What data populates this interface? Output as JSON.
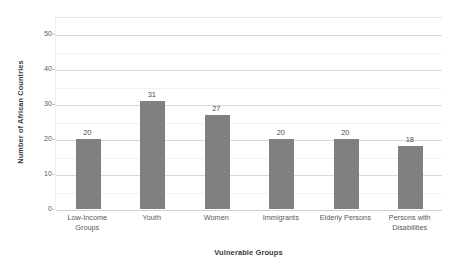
{
  "chart_data": {
    "type": "bar",
    "title": "",
    "xlabel": "Vulnerable Groups",
    "ylabel": "Number of African Countries",
    "categories": [
      "Low-Income Groups",
      "Youth",
      "Women",
      "Immigrants",
      "Elderly Persons",
      "Persons with Disabilities"
    ],
    "category_lines": [
      [
        "Low-Income",
        "Groups"
      ],
      [
        "Youth"
      ],
      [
        "Women"
      ],
      [
        "Immigrants"
      ],
      [
        "Elderly Persons"
      ],
      [
        "Persons with",
        "Disabilities"
      ]
    ],
    "values": [
      20,
      31,
      27,
      20,
      20,
      18
    ],
    "value_labels": [
      "20",
      "31",
      "27",
      "20",
      "20",
      "18"
    ],
    "ylim": [
      0,
      55
    ],
    "ytick_labels": [
      "0",
      "10",
      "20",
      "30",
      "40",
      "50"
    ],
    "ytick_values": [
      0,
      10,
      20,
      30,
      40,
      50
    ],
    "minor_tick_values": [
      5,
      15,
      25,
      35,
      45
    ],
    "grid": true,
    "legend": "none",
    "bar_color": "#808080",
    "gridline_color": "#d9d9d9",
    "minor_gridline_color": "#f1f1f1",
    "background_color": "#ffffff",
    "text_color": "#595959"
  }
}
